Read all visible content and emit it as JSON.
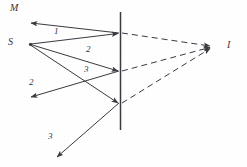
{
  "figure": {
    "type": "ray-optics-plane-mirror-diagram",
    "background_color": "#ffffff",
    "ink_color": "#3a3a42",
    "labels": {
      "mirror": "M",
      "source": "S",
      "image": "I",
      "ray_1": "1",
      "ray_2": "2",
      "ray_3": "3",
      "reflected_2": "2",
      "reflected_3": "3"
    },
    "points": {
      "source": {
        "x": 30,
        "y": 44
      },
      "image": {
        "x": 213,
        "y": 47
      },
      "mirror_top": {
        "x": 120,
        "y": 12
      },
      "mirror_bottom": {
        "x": 120,
        "y": 130
      },
      "incidence_1": {
        "x": 120,
        "y": 33
      },
      "incidence_2": {
        "x": 120,
        "y": 71
      },
      "incidence_3": {
        "x": 120,
        "y": 103
      },
      "reflected_end_1": {
        "x": 30,
        "y": 23
      },
      "reflected_end_2": {
        "x": 30,
        "y": 97
      },
      "reflected_end_3": {
        "x": 58,
        "y": 158
      }
    },
    "label_positions": {
      "mirror": {
        "x": 10,
        "y": 3
      },
      "source": {
        "x": 8,
        "y": 37
      },
      "image": {
        "x": 227,
        "y": 40
      },
      "ray_1": {
        "x": 54,
        "y": 27
      },
      "ray_2": {
        "x": 86,
        "y": 45
      },
      "ray_3": {
        "x": 84,
        "y": 65
      },
      "reflected_2": {
        "x": 29,
        "y": 78
      },
      "reflected_3": {
        "x": 48,
        "y": 132
      }
    },
    "elements": {
      "mirror_line": "solid vertical line",
      "incident_rays": "three solid arrows from S to mirror",
      "reflected_rays": "three solid arrows from mirror outward",
      "virtual_rays": "three dashed lines from mirror points to I"
    }
  }
}
